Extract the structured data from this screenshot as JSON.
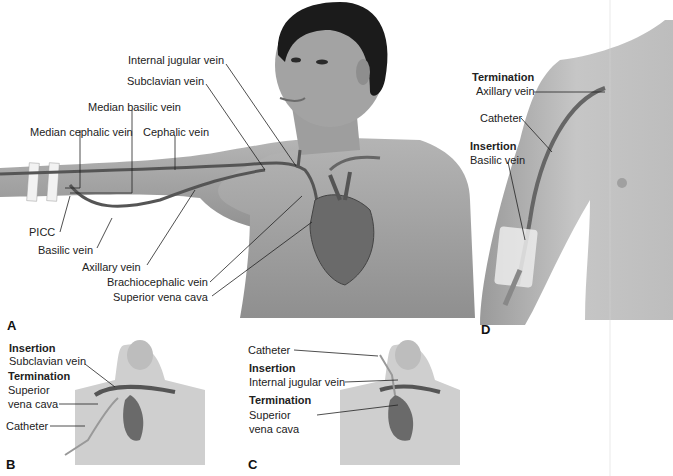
{
  "figure": {
    "panels": {
      "A": {
        "letter": "A",
        "labels": {
          "internal_jugular": "Internal jugular vein",
          "subclavian": "Subclavian vein",
          "median_basilic": "Median basilic vein",
          "median_cephalic": "Median cephalic vein",
          "cephalic": "Cephalic vein",
          "picc": "PICC",
          "basilic": "Basilic vein",
          "axillary": "Axillary vein",
          "brachiocephalic": "Brachiocephalic vein",
          "svc": "Superior vena cava"
        }
      },
      "B": {
        "letter": "B",
        "insertion_heading": "Insertion",
        "insertion_value": "Subclavian vein",
        "termination_heading": "Termination",
        "termination_value_1": "Superior",
        "termination_value_2": "vena cava",
        "catheter": "Catheter"
      },
      "C": {
        "letter": "C",
        "catheter": "Catheter",
        "insertion_heading": "Insertion",
        "insertion_value": "Internal jugular vein",
        "termination_heading": "Termination",
        "termination_value_1": "Superior",
        "termination_value_2": "vena cava"
      },
      "D": {
        "letter": "D",
        "termination_heading": "Termination",
        "termination_value": "Axillary vein",
        "catheter": "Catheter",
        "insertion_heading": "Insertion",
        "insertion_value": "Basilic vein"
      }
    },
    "colors": {
      "skin": "#a9a9a9",
      "skin_light": "#c9c9c9",
      "hair": "#1b1b1b",
      "vein": "#555555",
      "heart": "#6a6a6a",
      "tape": "#f2f2f2"
    }
  }
}
